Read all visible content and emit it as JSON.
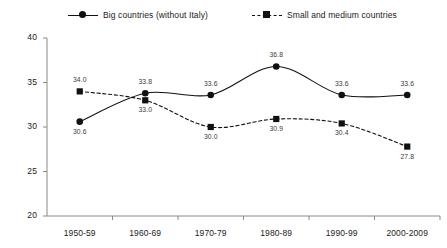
{
  "chart_data": {
    "type": "line",
    "title": "",
    "xlabel": "",
    "ylabel": "",
    "ylim": [
      20,
      40
    ],
    "yticks": [
      "20",
      "25",
      "30",
      "35",
      "40"
    ],
    "grid": false,
    "legend_position": "top",
    "categories": [
      "1950-59",
      "1960-69",
      "1970-79",
      "1980-89",
      "1990-99",
      "2000-2009"
    ],
    "series": [
      {
        "name": "Big countries (without Italy)",
        "marker": "circle",
        "line_style": "solid",
        "color": "#111111",
        "values": [
          30.6,
          33.8,
          33.6,
          36.8,
          33.6,
          33.6
        ],
        "labels": [
          "30.6",
          "33.8",
          "33.6",
          "36.8",
          "33.6",
          "33.6"
        ],
        "label_positions": [
          "below",
          "above",
          "above",
          "above",
          "above",
          "above"
        ]
      },
      {
        "name": "Small and medium countries",
        "marker": "square",
        "line_style": "dashed",
        "color": "#111111",
        "values": [
          34.0,
          33.0,
          30.0,
          30.9,
          30.4,
          27.8
        ],
        "labels": [
          "34.0",
          "33.0",
          "30.0",
          "30.9",
          "30.4",
          "27.8"
        ],
        "label_positions": [
          "above",
          "below",
          "below",
          "below",
          "below",
          "below"
        ]
      }
    ]
  },
  "legend": {
    "items": [
      {
        "label": "Big countries (without Italy)"
      },
      {
        "label": "Small and medium countries"
      }
    ]
  },
  "axes": {
    "y_ticks": [
      "40",
      "35",
      "30",
      "25",
      "20"
    ],
    "x_ticks": [
      "1950-59",
      "1960-69",
      "1970-79",
      "1980-89",
      "1990-99",
      "2000-2009"
    ]
  },
  "colors": {
    "line": "#111111",
    "axis": "#8a8a8a",
    "text": "#1a1a1a",
    "label_text": "#3a3a3a"
  }
}
